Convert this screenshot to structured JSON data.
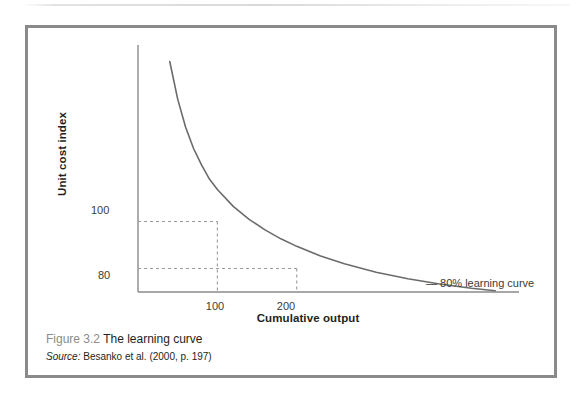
{
  "figure": {
    "caption_number": "Figure 3.2",
    "caption_title": "The learning curve",
    "source_label": "Source:",
    "source_text": "Besanko et al. (2000, p. 197)"
  },
  "chart_data": {
    "type": "line",
    "title": "The learning curve",
    "xlabel": "Cumulative output",
    "ylabel": "Unit cost index",
    "xticks": [
      "100",
      "200"
    ],
    "xtick_values": [
      100,
      200
    ],
    "yticks": [
      "100",
      "80"
    ],
    "ytick_values": [
      100,
      80
    ],
    "xlim": [
      0,
      480
    ],
    "ylim": [
      70,
      175
    ],
    "grid": false,
    "legend_position": "inline-right",
    "series": [
      {
        "name": "80% learning curve",
        "x": [
          40,
          50,
          60,
          70,
          80,
          90,
          100,
          120,
          140,
          160,
          180,
          200,
          230,
          260,
          300,
          340,
          380,
          420,
          450
        ],
        "y": [
          168,
          152,
          140,
          131,
          124,
          118,
          113.6,
          106.4,
          100.9,
          96.4,
          92.6,
          89.4,
          85.3,
          82.0,
          78.4,
          75.6,
          73.4,
          71.6,
          70.5
        ]
      }
    ],
    "annotations": [
      {
        "name": "curve-label",
        "text": "80% learning curve",
        "marker": "—"
      }
    ],
    "guide_lines": [
      {
        "name": "unit-cost-100-guide",
        "y_value": 100,
        "x_value": 100,
        "style": "dashed"
      },
      {
        "name": "unit-cost-80-guide",
        "y_value": 80,
        "x_value": 200,
        "style": "dashed"
      }
    ],
    "colors": {
      "curve": "#6b6b6b",
      "axis": "#8a8a8a",
      "guide": "#9a9a9a",
      "text": "#231f20",
      "caption_muted": "#8c8c8c",
      "frame": "#8a8a8a"
    }
  }
}
